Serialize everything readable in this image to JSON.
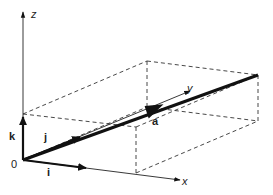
{
  "diagram": {
    "origin_label": "0",
    "axes": {
      "x": {
        "label": "x"
      },
      "y": {
        "label": "y"
      },
      "z": {
        "label": "z"
      }
    },
    "unit_vectors": {
      "i": {
        "label": "i"
      },
      "j": {
        "label": "j"
      },
      "k": {
        "label": "k"
      }
    },
    "vector": {
      "label": "a"
    },
    "box": {
      "style": "dashed",
      "description": "rectangular box whose diagonal is vector a"
    },
    "colors": {
      "line": "#111111",
      "background": "#ffffff"
    }
  }
}
